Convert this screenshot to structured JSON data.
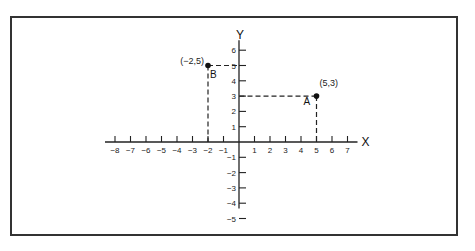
{
  "diagram": {
    "type": "cartesian-coordinate-plane",
    "axes": {
      "x_label": "X",
      "y_label": "Y",
      "x_ticks": [
        "-8",
        "-7",
        "-6",
        "-5",
        "-4",
        "-3",
        "-2",
        "-1",
        "1",
        "2",
        "3",
        "4",
        "5",
        "6",
        "7"
      ],
      "y_ticks": [
        "6",
        "5",
        "4",
        "3",
        "2",
        "1",
        "-1",
        "-2",
        "-3",
        "-4",
        "-5"
      ],
      "x_range": [
        -8,
        7
      ],
      "y_range": [
        -5,
        6
      ]
    },
    "points": [
      {
        "name": "A",
        "coords_label": "(5,3)",
        "x": 5,
        "y": 3
      },
      {
        "name": "B",
        "coords_label": "(−2,5)",
        "x": -2,
        "y": 5
      }
    ],
    "colors": {
      "line": "#222222",
      "frame": "#333333",
      "background": "#ffffff"
    }
  },
  "chart_data": {
    "type": "scatter",
    "title": "",
    "xlabel": "X",
    "ylabel": "Y",
    "x": [
      5,
      -2
    ],
    "y": [
      3,
      5
    ],
    "labels": [
      "A (5,3)",
      "B (-2,5)"
    ],
    "xlim": [
      -8,
      7
    ],
    "ylim": [
      -5,
      6
    ],
    "grid": false,
    "annotations": [
      "dashed projection lines from each point to both axes"
    ]
  }
}
